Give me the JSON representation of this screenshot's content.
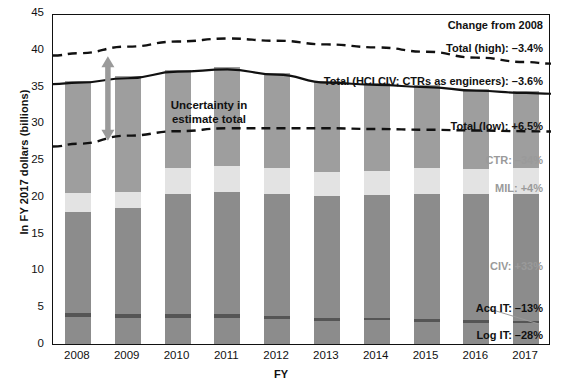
{
  "chart_data": {
    "type": "bar",
    "title": "",
    "xlabel": "FY",
    "ylabel": "In FY 2017 dollars (billions)",
    "ylim": [
      0,
      45
    ],
    "yticks": [
      0,
      5,
      10,
      15,
      20,
      25,
      30,
      35,
      40,
      45
    ],
    "grid": false,
    "legend_position": "inline-right",
    "stacked": true,
    "categories": [
      "2008",
      "2009",
      "2010",
      "2011",
      "2012",
      "2013",
      "2014",
      "2015",
      "2016",
      "2017"
    ],
    "series": [
      {
        "name": "Log IT",
        "color": "#8c8c8c",
        "values": [
          3.7,
          3.6,
          3.6,
          3.6,
          3.4,
          3.1,
          3.2,
          3.0,
          2.9,
          2.8
        ]
      },
      {
        "name": "Acq IT",
        "color": "#555555",
        "values": [
          0.45,
          0.45,
          0.45,
          0.45,
          0.42,
          0.4,
          0.4,
          0.38,
          0.38,
          0.36
        ]
      },
      {
        "name": "CIV",
        "color": "#8c8c8c",
        "values": [
          13.75,
          14.5,
          16.3,
          16.6,
          16.6,
          16.6,
          16.6,
          17.0,
          17.1,
          17.2
        ]
      },
      {
        "name": "MIL",
        "color": "#e3e3e3",
        "values": [
          2.6,
          2.1,
          3.6,
          3.6,
          3.5,
          3.3,
          3.3,
          3.5,
          3.4,
          3.5
        ]
      },
      {
        "name": "CTR",
        "color": "#9e9e9e",
        "values": [
          15.3,
          15.75,
          13.35,
          13.35,
          12.98,
          12.4,
          12.0,
          11.32,
          10.92,
          10.54
        ]
      }
    ],
    "totals": [
      35.8,
      36.4,
      37.3,
      37.6,
      36.9,
      35.8,
      35.5,
      35.2,
      34.7,
      34.4
    ],
    "lines": [
      {
        "name": "Total (high)",
        "style": "dashed",
        "color": "#111111",
        "values": [
          39.8,
          40.7,
          41.4,
          41.8,
          41.5,
          41.0,
          40.6,
          40.0,
          39.2,
          38.6
        ]
      },
      {
        "name": "Total (HCI CIV; CTRs as engineers)",
        "style": "solid",
        "color": "#111111",
        "values": [
          35.8,
          36.4,
          37.3,
          37.6,
          36.9,
          35.8,
          35.5,
          35.2,
          34.7,
          34.4
        ]
      },
      {
        "name": "Total (low)",
        "style": "dashed",
        "color": "#111111",
        "values": [
          27.5,
          28.6,
          29.2,
          29.6,
          29.6,
          29.6,
          29.5,
          29.4,
          29.3,
          29.2
        ]
      }
    ]
  },
  "annotations": {
    "change_header": "Change from 2008",
    "total_high": "Total (high): –3.4%",
    "total_mid": "Total (HCI CIV; CTRs as engineers): –3.6%",
    "total_low": "Total (low): +6.5%",
    "ctr": "CTR: –34%",
    "mil": "MIL: +4%",
    "civ": "CIV: +33%",
    "acq_it": "Acq IT: –13%",
    "log_it": "Log IT: –28%",
    "uncertainty_line1": "Uncertainty in",
    "uncertainty_line2": "estimate total"
  },
  "colors": {
    "ctr": "#9e9e9e",
    "mil": "#e3e3e3",
    "civ": "#8c8c8c",
    "acq_it": "#555555",
    "log_it": "#8c8c8c",
    "line": "#111111",
    "arrow": "#9a9a9a",
    "label_grey": "#9a9a9a",
    "axis": "#111111"
  }
}
